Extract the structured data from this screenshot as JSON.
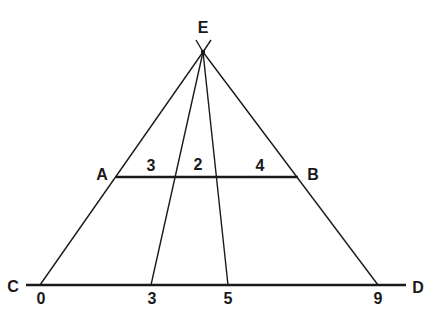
{
  "diagram": {
    "type": "geometry-proportional-segments",
    "apex": {
      "label": "E",
      "x": 203,
      "y": 52,
      "label_x": 203,
      "label_y": 33
    },
    "upper_line": {
      "start": {
        "label": "A",
        "x": 116,
        "y": 177,
        "label_x": 102,
        "label_y": 180
      },
      "end": {
        "label": "B",
        "x": 298,
        "y": 177,
        "label_x": 313,
        "label_y": 180
      },
      "segment_labels": [
        {
          "text": "3",
          "x": 151,
          "y": 171
        },
        {
          "text": "2",
          "x": 198,
          "y": 170
        },
        {
          "text": "4",
          "x": 260,
          "y": 171
        }
      ]
    },
    "base_line": {
      "start": {
        "label": "C",
        "x": 26,
        "y": 285,
        "label_x": 13,
        "label_y": 292
      },
      "end": {
        "label": "D",
        "x": 406,
        "y": 285,
        "label_x": 418,
        "label_y": 293
      },
      "tick_labels": [
        {
          "text": "0",
          "x": 41,
          "y": 304
        },
        {
          "text": "3",
          "x": 152,
          "y": 304
        },
        {
          "text": "5",
          "x": 228,
          "y": 304
        },
        {
          "text": "9",
          "x": 378,
          "y": 304
        }
      ]
    },
    "rays": [
      {
        "name": "ray-to-0",
        "x2": 40,
        "y2": 285
      },
      {
        "name": "ray-to-3",
        "x2": 151,
        "y2": 285
      },
      {
        "name": "ray-to-5",
        "x2": 228,
        "y2": 285
      },
      {
        "name": "ray-to-9",
        "x2": 378,
        "y2": 285
      }
    ],
    "apex_tick": {
      "left_x": 196,
      "right_x": 211,
      "top_y": 40
    },
    "stroke_color": "#1a1a1a"
  }
}
